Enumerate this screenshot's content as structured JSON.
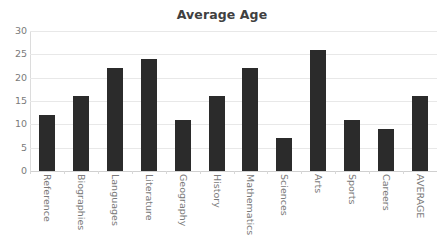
{
  "chart_data": {
    "type": "bar",
    "title": "Average Age",
    "xlabel": "",
    "ylabel": "",
    "categories": [
      "Reference",
      "Biographies",
      "Languages",
      "Literature",
      "Geography",
      "History",
      "Mathematics",
      "Sciences",
      "Arts",
      "Sports",
      "Careers",
      "AVERAGE"
    ],
    "values": [
      12,
      16,
      22,
      24,
      11,
      16,
      22,
      7,
      26,
      11,
      9,
      16
    ],
    "ylim": [
      0,
      30
    ],
    "yticks": [
      0,
      5,
      10,
      15,
      20,
      25,
      30
    ],
    "ytick_labels": [
      "0",
      "5",
      "10",
      "15",
      "20",
      "25",
      "30"
    ],
    "grid": true,
    "legend": false,
    "bar_color": "#2b2b2b",
    "gridline_color": "#e8e8e8",
    "title_color": "#404040",
    "tick_label_color": "#7a7a7a"
  }
}
